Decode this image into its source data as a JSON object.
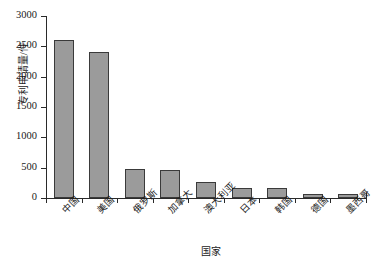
{
  "chart_data": {
    "type": "bar",
    "title": "",
    "xlabel": "国家",
    "ylabel": "专利申请量/件",
    "categories": [
      "中国",
      "美国",
      "俄罗斯",
      "加拿大",
      "澳大利亚",
      "日本",
      "韩国",
      "德国",
      "墨西哥"
    ],
    "values": [
      2600,
      2400,
      480,
      470,
      260,
      170,
      170,
      70,
      60
    ],
    "ylim": [
      0,
      3000
    ],
    "ytick_labels": [
      "0",
      "500",
      "1000",
      "1500",
      "2000",
      "2500",
      "3000"
    ],
    "ytick_values": [
      0,
      500,
      1000,
      1500,
      2000,
      2500,
      3000
    ],
    "grid": false,
    "legend": "none",
    "bar_fill_color": "#9b9b9b",
    "bar_edge_color": "#3a3a3a",
    "axis_color": "#2a2a2a",
    "background_color": "#ffffff"
  }
}
